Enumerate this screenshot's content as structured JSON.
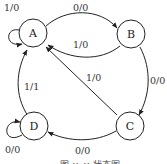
{
  "diagram": {
    "type": "state-transition",
    "states": [
      {
        "id": "A",
        "label": "A"
      },
      {
        "id": "B",
        "label": "B"
      },
      {
        "id": "C",
        "label": "C"
      },
      {
        "id": "D",
        "label": "D"
      }
    ],
    "transitions": [
      {
        "from": "A",
        "to": "A",
        "label": "1/0"
      },
      {
        "from": "A",
        "to": "B",
        "label": "0/0"
      },
      {
        "from": "B",
        "to": "A",
        "label": "1/0"
      },
      {
        "from": "B",
        "to": "C",
        "label": "0/0"
      },
      {
        "from": "C",
        "to": "A",
        "label": "1/0"
      },
      {
        "from": "C",
        "to": "D",
        "label": "0/0"
      },
      {
        "from": "D",
        "to": "A",
        "label": "1/1"
      },
      {
        "from": "D",
        "to": "D",
        "label": "0/0"
      }
    ],
    "caption": "图 ×-× 状态图"
  },
  "colors": {
    "stroke": "#222222",
    "background": "#ffffff"
  }
}
